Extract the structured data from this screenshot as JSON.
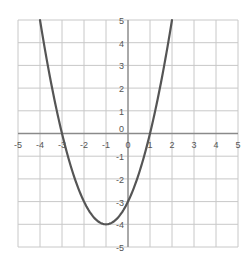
{
  "chart_data": {
    "type": "line",
    "title": "",
    "xlabel": "",
    "ylabel": "",
    "xlim": [
      -5,
      5
    ],
    "ylim": [
      -5,
      5
    ],
    "grid": true,
    "x_ticks": [
      -5,
      -4,
      -3,
      -2,
      -1,
      0,
      1,
      2,
      3,
      4,
      5
    ],
    "y_ticks": [
      -5,
      -4,
      -3,
      -2,
      -1,
      0,
      1,
      2,
      3,
      4,
      5
    ],
    "series": [
      {
        "name": "y = x^2 + 2x - 3",
        "x": [
          -4,
          -3.5,
          -3,
          -2.5,
          -2,
          -1.5,
          -1,
          -0.5,
          0,
          0.5,
          1,
          1.5,
          2
        ],
        "y": [
          5,
          2.25,
          0,
          -1.75,
          -3,
          -3.75,
          -4,
          -3.75,
          -3,
          -1.75,
          0,
          2.25,
          5
        ],
        "color": "#555555"
      }
    ],
    "key_points": {
      "vertex": [
        -1,
        -4
      ],
      "roots": [
        -3,
        1
      ],
      "y_intercept": -3
    }
  },
  "colors": {
    "grid": "#c8c8c8",
    "axis": "#8a8a8a",
    "curve": "#555555",
    "label": "#555555"
  }
}
